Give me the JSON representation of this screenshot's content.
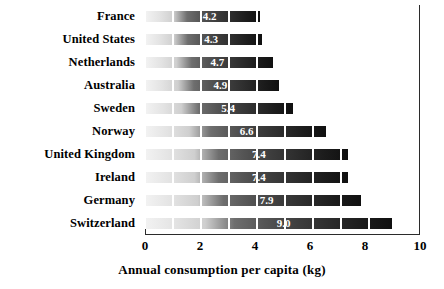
{
  "chart_data": {
    "type": "bar",
    "orientation": "horizontal",
    "title": "",
    "subtitle": "",
    "xlabel": "Annual consumption per capita (kg)",
    "ylabel": "",
    "categories": [
      "France",
      "United States",
      "Netherlands",
      "Australia",
      "Sweden",
      "Norway",
      "United Kingdom",
      "Ireland",
      "Germany",
      "Switzerland"
    ],
    "values": [
      4.2,
      4.3,
      4.7,
      4.9,
      5.4,
      6.6,
      7.4,
      7.4,
      7.9,
      9.0
    ],
    "value_labels": [
      "4.2",
      "4.3",
      "4.7",
      "4.9",
      "5.4",
      "6.6",
      "7.4",
      "7.4",
      "7.9",
      "9.0"
    ],
    "xlim": [
      0,
      10
    ],
    "xticks": [
      0,
      2,
      4,
      6,
      8,
      10
    ],
    "xtick_labels": [
      "0",
      "2",
      "4",
      "6",
      "8",
      "10"
    ],
    "grid": false,
    "legend": null,
    "bar_style": "light-to-dark grayscale segmented gradient",
    "colors": {
      "axis": "#2b2b2b",
      "text": "#000000",
      "value_label": "#ffffff",
      "bar_light": "#f2f2f2",
      "bar_dark": "#101010",
      "background": "#ffffff"
    }
  }
}
